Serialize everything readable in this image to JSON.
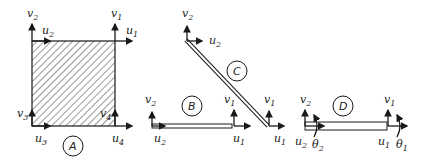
{
  "figure": {
    "elements": [
      {
        "id": "A",
        "label": "A",
        "type": "rectangle-plane-element",
        "nodes": [
          {
            "n": "1",
            "labels": [
              "u1",
              "v1"
            ]
          },
          {
            "n": "2",
            "labels": [
              "u2",
              "v2"
            ]
          },
          {
            "n": "3",
            "labels": [
              "u3",
              "v3"
            ]
          },
          {
            "n": "4",
            "labels": [
              "u4",
              "v4"
            ]
          }
        ]
      },
      {
        "id": "B",
        "label": "B",
        "type": "bar-element",
        "nodes": [
          {
            "n": "1",
            "labels": [
              "u1",
              "v1"
            ]
          },
          {
            "n": "2",
            "labels": [
              "u2",
              "v2"
            ]
          }
        ]
      },
      {
        "id": "C",
        "label": "C",
        "type": "inclined-bar-element",
        "nodes": [
          {
            "n": "1",
            "labels": [
              "u1",
              "v1"
            ]
          },
          {
            "n": "2",
            "labels": [
              "u2",
              "v2"
            ]
          }
        ]
      },
      {
        "id": "D",
        "label": "D",
        "type": "beam-element",
        "nodes": [
          {
            "n": "1",
            "labels": [
              "u1",
              "v1",
              "θ1"
            ]
          },
          {
            "n": "2",
            "labels": [
              "u2",
              "v2",
              "θ2"
            ]
          }
        ]
      }
    ],
    "colors": {
      "ink": "#1a1a1a",
      "background": "#ffffff"
    }
  }
}
